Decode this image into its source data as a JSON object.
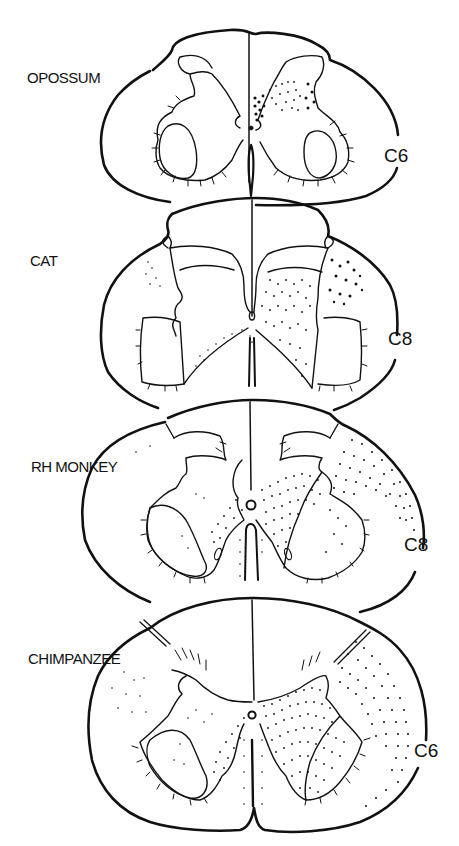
{
  "figure": {
    "colors": {
      "ink": "#111111",
      "paper": "#ffffff"
    },
    "sections": [
      {
        "species": "OPOSSUM",
        "segment": "C6"
      },
      {
        "species": "CAT",
        "segment": "C8"
      },
      {
        "species": "RH MONKEY",
        "segment": "C8"
      },
      {
        "species": "CHIMPANZEE",
        "segment": "C6"
      }
    ]
  }
}
